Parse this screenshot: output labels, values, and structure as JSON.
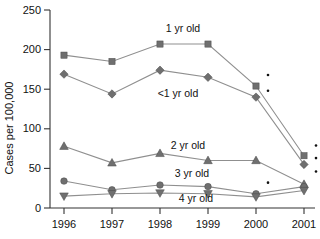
{
  "chart_data": {
    "type": "line",
    "title": "",
    "xlabel": "",
    "ylabel": "Cases per 100,000",
    "categories": [
      "1996",
      "1997",
      "1998",
      "1999",
      "2000",
      "2001"
    ],
    "ylim": [
      0,
      250
    ],
    "yticks": [
      0,
      50,
      100,
      150,
      200,
      250
    ],
    "grid": false,
    "legend_position": "inline-annotations",
    "series": [
      {
        "name": "1 yr old",
        "marker": "square",
        "color": "#6f6f6f",
        "label": "1 yr old",
        "values": [
          193,
          185,
          207,
          207,
          154,
          66
        ]
      },
      {
        "name": "<1 yr old",
        "marker": "diamond",
        "color": "#6f6f6f",
        "label": "<1 yr old",
        "values": [
          169,
          144,
          174,
          165,
          140,
          55
        ]
      },
      {
        "name": "2 yr old",
        "marker": "triangle-up",
        "color": "#6f6f6f",
        "label": "2 yr old",
        "values": [
          78,
          57,
          69,
          60,
          60,
          30
        ]
      },
      {
        "name": "3 yr old",
        "marker": "circle",
        "color": "#6f6f6f",
        "label": "3 yr old",
        "values": [
          34,
          23,
          29,
          27,
          18,
          27
        ]
      },
      {
        "name": "4 yr old",
        "marker": "triangle-down",
        "color": "#6f6f6f",
        "label": "4 yr old",
        "values": [
          15,
          18,
          19,
          18,
          14,
          22
        ]
      }
    ],
    "annotations": [
      {
        "name": "asterisk-2000-a",
        "x": "2000",
        "y": 168,
        "symbol": "*"
      },
      {
        "name": "asterisk-2000-b",
        "x": "2000",
        "y": 148,
        "symbol": "*"
      },
      {
        "name": "asterisk-2000-c",
        "x": "2000",
        "y": 32,
        "symbol": "*"
      },
      {
        "name": "asterisk-2001-a",
        "x": "2001",
        "y": 79,
        "symbol": "*"
      },
      {
        "name": "asterisk-2001-b",
        "x": "2001",
        "y": 63,
        "symbol": "*"
      },
      {
        "name": "asterisk-2001-c",
        "x": "2001",
        "y": 46,
        "symbol": "*"
      }
    ]
  },
  "axis": {
    "y_title": "Cases per 100,000",
    "y_tick_labels": [
      "250",
      "200",
      "150",
      "100",
      "50",
      "0"
    ],
    "x_tick_labels": [
      "1996",
      "1997",
      "1998",
      "1999",
      "2000",
      "2001"
    ]
  },
  "colors": {
    "marker": "#6f6f6f",
    "line": "#8f8f8f",
    "axis": "#333333",
    "text": "#111111"
  }
}
